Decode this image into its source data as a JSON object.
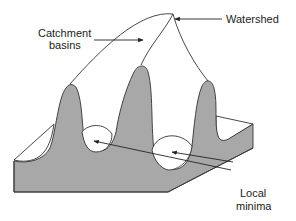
{
  "diagram": {
    "labels": {
      "catchment_line1": "Catchment",
      "catchment_line2": "basins",
      "watershed": "Watershed",
      "local_line1": "Local",
      "local_line2": "minima"
    },
    "colors": {
      "terrain": "#a8a8a8",
      "outline": "#333333",
      "background": "#ffffff"
    }
  }
}
